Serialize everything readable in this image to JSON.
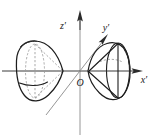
{
  "figure": {
    "kind": "two-sheeted-hyperboloid-3d-axes",
    "background_color": "#ffffff",
    "width": 156,
    "height": 138,
    "labels": {
      "x_axis": "x′",
      "y_axis": "y′",
      "z_axis": "z′",
      "origin": "O"
    },
    "colors": {
      "outline": "#1d1d1d",
      "hidden_edge": "#9b9b9b",
      "axis": "#3a3a3a",
      "axis_thin": "#8a8a8a",
      "arrow": "#2b2b2b",
      "label": "#1a1a1a"
    },
    "axes": [
      {
        "name": "x-prime-axis",
        "label": "x′",
        "direction": "right",
        "has_arrow": true,
        "from": [
          2,
          71
        ],
        "to": [
          140,
          71
        ],
        "label_pos": [
          141,
          80
        ]
      },
      {
        "name": "z-prime-axis",
        "label": "z′",
        "direction": "up",
        "has_arrow": true,
        "from": [
          80,
          134
        ],
        "to": [
          80,
          12
        ],
        "label_pos": [
          64,
          26
        ]
      },
      {
        "name": "y-prime-axis",
        "label": "y′",
        "direction": "upper-right",
        "has_arrow": true,
        "from": [
          48,
          112
        ],
        "to": [
          106,
          37
        ],
        "label_pos": [
          106,
          32
        ]
      }
    ],
    "origin": {
      "name": "origin",
      "label": "O",
      "pos": [
        80,
        71
      ],
      "label_pos": [
        82,
        84
      ]
    },
    "sheets": [
      {
        "name": "left-sheet",
        "side": "negative-x",
        "vertex": [
          63,
          71
        ],
        "cross_section_style": "dashed",
        "description": "left sheet of two-sheeted hyperboloid, opening toward -x, hidden cross-section ellipses drawn dashed"
      },
      {
        "name": "right-sheet",
        "side": "positive-x",
        "vertex": [
          88,
          71
        ],
        "cross_section_style": "solid",
        "description": "right sheet of two-sheeted hyperboloid, opening toward +x, visible cross-section ellipse drawn solid"
      }
    ]
  }
}
